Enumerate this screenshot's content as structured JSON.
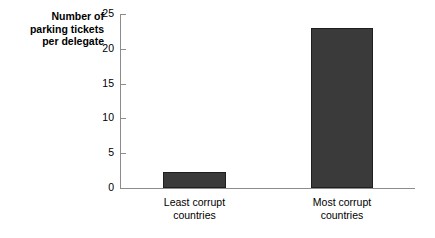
{
  "chart_data": {
    "type": "bar",
    "title": "",
    "xlabel": "",
    "ylabel": "Number of\nparking tickets\nper delegate",
    "categories": [
      "Least corrupt\ncountries",
      "Most corrupt\ncountries"
    ],
    "values": [
      2.3,
      23
    ],
    "ylim": [
      0,
      25
    ],
    "yticks": [
      0,
      5,
      10,
      15,
      20,
      25
    ],
    "ytick_labels": [
      "0",
      "5",
      "10",
      "15",
      "20",
      "25"
    ],
    "grid": false,
    "legend": "none",
    "bar_color": "#3a3a3a",
    "axis_color": "#8c8c8c",
    "background": "#ffffff"
  }
}
